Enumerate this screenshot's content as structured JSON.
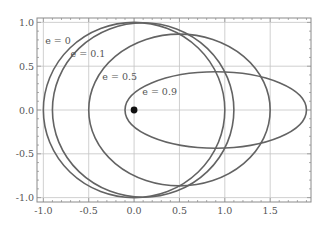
{
  "chart_data": {
    "type": "line",
    "title": "",
    "xlabel": "",
    "ylabel": "",
    "xlim": [
      -1.07,
      1.95
    ],
    "ylim": [
      -1.05,
      1.05
    ],
    "grid": true,
    "legend": "none",
    "x_ticks": [
      -1.0,
      -0.5,
      0.0,
      0.5,
      1.0,
      1.5
    ],
    "x_tick_labels": [
      "-1.0",
      "-0.5",
      "0.0",
      "0.5",
      "1.0",
      "1.5"
    ],
    "y_ticks": [
      -1.0,
      -0.5,
      0.0,
      0.5,
      1.0
    ],
    "y_tick_labels": [
      "-1.0",
      "-0.5",
      "0.0",
      "0.5",
      "1.0"
    ],
    "minor_tick_step": 0.1,
    "series": [
      {
        "name": "e = 0",
        "eccentricity": 0.0,
        "semi_major": 1.0,
        "center_x": 0.0,
        "semi_minor": 1.0,
        "x_range": [
          -1.0,
          1.0
        ],
        "label_pos": [
          -0.98,
          0.75
        ]
      },
      {
        "name": "e = 0.1",
        "eccentricity": 0.1,
        "semi_major": 1.0,
        "center_x": 0.1,
        "semi_minor": 0.995,
        "x_range": [
          -0.9,
          1.1
        ],
        "label_pos": [
          -0.7,
          0.61
        ]
      },
      {
        "name": "e = 0.5",
        "eccentricity": 0.5,
        "semi_major": 1.0,
        "center_x": 0.5,
        "semi_minor": 0.866,
        "x_range": [
          -0.5,
          1.5
        ],
        "label_pos": [
          -0.35,
          0.34
        ]
      },
      {
        "name": "e = 0.9",
        "eccentricity": 0.9,
        "semi_major": 1.0,
        "center_x": 0.9,
        "semi_minor": 0.436,
        "x_range": [
          -0.1,
          1.9
        ],
        "label_pos": [
          0.09,
          0.17
        ]
      }
    ],
    "annotations": [
      {
        "type": "point",
        "label": "focus",
        "x": 0.0,
        "y": 0.0
      }
    ]
  },
  "colors": {
    "curve": "#636363",
    "grid": "#c4c4c4",
    "frame": "#8a8a8a",
    "point": "#111111"
  }
}
